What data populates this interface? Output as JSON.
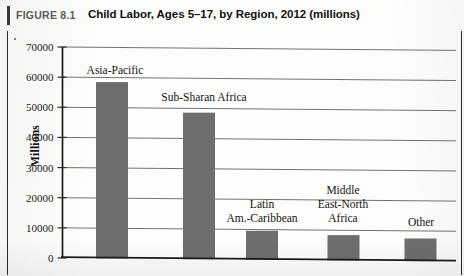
{
  "caption": {
    "figure_number": "FIGURE 8.1",
    "title": "Child Labor, Ages 5–17, by Region, 2012 (millions)"
  },
  "chart_data": {
    "type": "bar",
    "title": "Child Labor, Ages 5–17, by Region, 2012 (millions)",
    "xlabel": "",
    "ylabel": "Millions",
    "ylim": [
      0,
      70000
    ],
    "ytick_step": 10000,
    "ytick_labels": [
      "0",
      "10000",
      "20000",
      "30000",
      "40000",
      "50000",
      "60000",
      "70000"
    ],
    "grid": true,
    "legend": "none",
    "categories": [
      "Asia-Pacific",
      "Sub-Sharan Africa",
      "Latin Am.-Caribbean",
      "Middle East-North Africa",
      "Other"
    ],
    "category_label_lines": [
      [
        "Asia-Pacific"
      ],
      [
        "Sub-Sharan Africa"
      ],
      [
        "Latin",
        "Am.-Caribbean"
      ],
      [
        "Middle",
        "East-North",
        "Africa"
      ],
      [
        "Other"
      ]
    ],
    "values": [
      58500,
      48600,
      9600,
      8400,
      7500
    ],
    "bar_color": "#6e6e6e"
  },
  "colors": {
    "bar": "#6e6e6e",
    "grid": "#5a5a5a",
    "axis": "#1b1b1b",
    "caption_number": "#5d5d5d",
    "caption_title": "#111111",
    "page_background": "#fdfdfb"
  }
}
